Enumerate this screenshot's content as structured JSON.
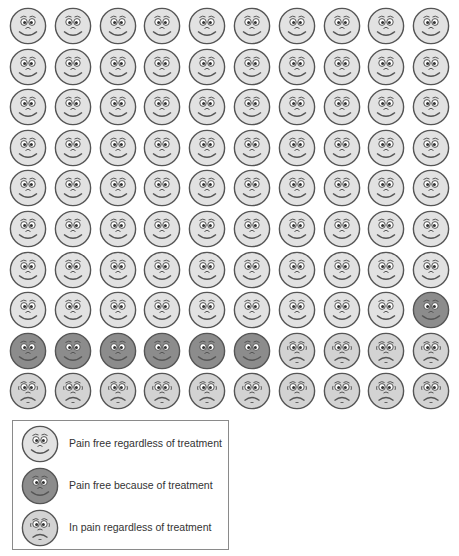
{
  "chart_data": {
    "type": "pictogram",
    "title": "",
    "grid": {
      "rows": 10,
      "cols": 10,
      "total": 100
    },
    "categories": [
      "Pain free regardless of treatment",
      "Pain free because of treatment",
      "In pain regardless of treatment"
    ],
    "values": [
      79,
      7,
      14
    ],
    "series": [
      {
        "name": "Pain free regardless of treatment",
        "key": "happy",
        "count": 79,
        "fill": "#e2e2e2"
      },
      {
        "name": "Pain free because of treatment",
        "key": "treated",
        "count": 7,
        "fill": "#8c8c8c"
      },
      {
        "name": "In pain regardless of treatment",
        "key": "sad",
        "count": 14,
        "fill": "#d3d3d3"
      }
    ],
    "layout": [
      [
        "happy",
        "happy",
        "happy",
        "happy",
        "happy",
        "happy",
        "happy",
        "happy",
        "happy",
        "happy"
      ],
      [
        "happy",
        "happy",
        "happy",
        "happy",
        "happy",
        "happy",
        "happy",
        "happy",
        "happy",
        "happy"
      ],
      [
        "happy",
        "happy",
        "happy",
        "happy",
        "happy",
        "happy",
        "happy",
        "happy",
        "happy",
        "happy"
      ],
      [
        "happy",
        "happy",
        "happy",
        "happy",
        "happy",
        "happy",
        "happy",
        "happy",
        "happy",
        "happy"
      ],
      [
        "happy",
        "happy",
        "happy",
        "happy",
        "happy",
        "happy",
        "happy",
        "happy",
        "happy",
        "happy"
      ],
      [
        "happy",
        "happy",
        "happy",
        "happy",
        "happy",
        "happy",
        "happy",
        "happy",
        "happy",
        "happy"
      ],
      [
        "happy",
        "happy",
        "happy",
        "happy",
        "happy",
        "happy",
        "happy",
        "happy",
        "happy",
        "happy"
      ],
      [
        "happy",
        "happy",
        "happy",
        "happy",
        "happy",
        "happy",
        "happy",
        "happy",
        "happy",
        "treated"
      ],
      [
        "treated",
        "treated",
        "treated",
        "treated",
        "treated",
        "treated",
        "sad",
        "sad",
        "sad",
        "sad"
      ],
      [
        "sad",
        "sad",
        "sad",
        "sad",
        "sad",
        "sad",
        "sad",
        "sad",
        "sad",
        "sad"
      ]
    ],
    "legend_position": "bottom-left"
  },
  "legend": {
    "items": [
      {
        "key": "happy",
        "label": "Pain free regardless of treatment",
        "icon": "smiling-face-icon"
      },
      {
        "key": "treated",
        "label": "Pain free because of treatment",
        "icon": "smiling-face-dark-icon"
      },
      {
        "key": "sad",
        "label": "In pain regardless of treatment",
        "icon": "sad-face-icon"
      }
    ]
  },
  "colors": {
    "happy_fill": "#e2e2e2",
    "treated_fill": "#8c8c8c",
    "sad_fill": "#d3d3d3",
    "stroke": "#555555",
    "legend_border": "#8a8a8a"
  }
}
